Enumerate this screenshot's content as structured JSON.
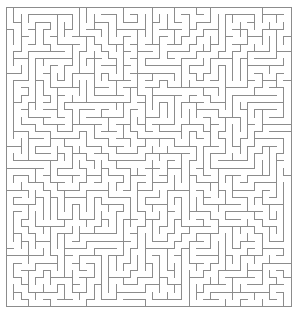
{
  "figure": {
    "type": "maze",
    "title": ""
  },
  "canvas": {
    "width": 297,
    "height": 316,
    "background_color": "#ffffff"
  },
  "maze": {
    "cols": 39,
    "rows": 41,
    "cell_size": 7.3,
    "origin_x": 6,
    "origin_y": 7,
    "wall_color": "#8c8c8c",
    "wall_width": 1,
    "border_color": "#8c8c8c",
    "border_width": 1,
    "passage_color": "#ffffff",
    "entrance": "none",
    "exit": "none",
    "perfect": true,
    "seed": 20240517,
    "algorithm": "recursive-backtracker"
  },
  "labels": {
    "top_border": "solid",
    "bottom_border": "solid",
    "left_border": "solid",
    "right_border": "solid"
  }
}
